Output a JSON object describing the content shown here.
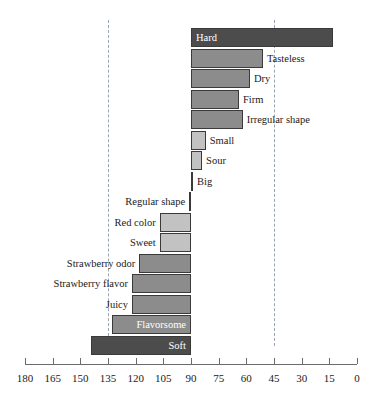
{
  "chart_data": {
    "type": "bar",
    "orientation": "horizontal",
    "title": "",
    "subtitle": "",
    "xlabel": "",
    "ylabel": "",
    "xlim": [
      180,
      0
    ],
    "x_axis_reversed": true,
    "baseline": 90,
    "grid": false,
    "legend": "none",
    "reference_lines": [
      135,
      45
    ],
    "tick_labels": [
      "180",
      "165",
      "150",
      "135",
      "120",
      "105",
      "90",
      "75",
      "60",
      "45",
      "30",
      "15",
      "0"
    ],
    "tick_values": [
      180,
      165,
      150,
      135,
      120,
      105,
      90,
      75,
      60,
      45,
      30,
      15,
      0
    ],
    "categories": [
      "Hard",
      "Tasteless",
      "Dry",
      "Firm",
      "Irregular shape",
      "Small",
      "Sour",
      "Big",
      "Regular shape",
      "Red color",
      "Sweet",
      "Strawberry odor",
      "Strawberry flavor",
      "Juicy",
      "Flavorsome",
      "Soft"
    ],
    "values": [
      13,
      51,
      58,
      64,
      62,
      82,
      84,
      89,
      89,
      107,
      107,
      118,
      122,
      122,
      133,
      144
    ],
    "bars": [
      {
        "label": "Hard",
        "value": 13,
        "shade": "dark",
        "label_position": "inside-left"
      },
      {
        "label": "Tasteless",
        "value": 51,
        "shade": "mid",
        "label_position": "right"
      },
      {
        "label": "Dry",
        "value": 58,
        "shade": "mid",
        "label_position": "right"
      },
      {
        "label": "Firm",
        "value": 64,
        "shade": "mid",
        "label_position": "right"
      },
      {
        "label": "Irregular shape",
        "value": 62,
        "shade": "mid",
        "label_position": "right"
      },
      {
        "label": "Small",
        "value": 82,
        "shade": "light",
        "label_position": "right"
      },
      {
        "label": "Sour",
        "value": 84,
        "shade": "light",
        "label_position": "right"
      },
      {
        "label": "Big",
        "value": 89,
        "shade": "dark",
        "label_position": "right"
      },
      {
        "label": "Regular shape",
        "value": 91,
        "shade": "light",
        "label_position": "left"
      },
      {
        "label": "Red color",
        "value": 107,
        "shade": "light",
        "label_position": "left"
      },
      {
        "label": "Sweet",
        "value": 107,
        "shade": "light",
        "label_position": "left"
      },
      {
        "label": "Strawberry odor",
        "value": 118,
        "shade": "mid",
        "label_position": "left"
      },
      {
        "label": "Strawberry flavor",
        "value": 122,
        "shade": "mid",
        "label_position": "left"
      },
      {
        "label": "Juicy",
        "value": 122,
        "shade": "mid",
        "label_position": "left"
      },
      {
        "label": "Flavorsome",
        "value": 133,
        "shade": "mid",
        "label_position": "inside-right"
      },
      {
        "label": "Soft",
        "value": 144,
        "shade": "dark",
        "label_position": "inside-right"
      }
    ],
    "colors": {
      "dark": "#4c4c4c",
      "mid": "#8c8c8c",
      "light": "#c2c2c2",
      "bar_border": "#3a3a3a",
      "axis": "#6b6b6b",
      "reference_line": "#9aa3b0",
      "text": "#1a1a1a",
      "inside_label_text": "#ffffff",
      "background": "#ffffff"
    }
  }
}
